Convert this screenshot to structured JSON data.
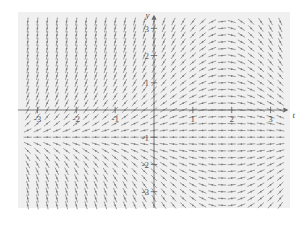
{
  "figure": {
    "background_color": "#ffffff",
    "plot_background_color": "#f0f0f0",
    "axis_color": "#6b6b6b",
    "slope_color": "#8c8c8c",
    "point_color": "#7a7a7a"
  },
  "chart_data": {
    "type": "scatter",
    "subtype": "slope-field",
    "title": "",
    "xlabel": "t",
    "ylabel": "y",
    "xlim": [
      -3.5,
      3.5
    ],
    "ylim": [
      -3.6,
      3.6
    ],
    "grid": false,
    "legend": null,
    "xticks": [
      -3,
      -2,
      -1,
      1,
      2,
      3
    ],
    "xtick_labels": [
      "-3",
      "-2",
      "-1",
      "1",
      "2",
      "3"
    ],
    "yticks": [
      3,
      2,
      1,
      -1,
      -2,
      -3
    ],
    "ytick_labels": [
      "3",
      "2",
      "1",
      "-1",
      "-2",
      "-3"
    ],
    "equilibrium_lines": [
      -1
    ],
    "slope_model": "dy/dt = (y + 1) * (1 - 0.55 * t)",
    "sample_step_x": 0.25,
    "sample_step_y": 0.25,
    "annotations": []
  },
  "axes": {
    "x_axis_label": "t",
    "y_axis_label": "y",
    "x_arrow": "arrow-right",
    "y_arrow": "arrow-up"
  }
}
